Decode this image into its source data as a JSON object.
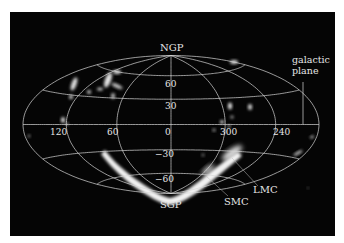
{
  "figure": {
    "background_color": "#050505",
    "grid_color": "#d8d8d8",
    "emission_color": "#ffffff",
    "projection": {
      "center_x": 171,
      "center_y": 124.5,
      "radius_x": 148,
      "radius_y": 69
    },
    "labels": {
      "north_pole": "NGP",
      "south_pole": "SGP",
      "galactic_plane": "galactic",
      "galactic_plane_2": "plane",
      "lmc": "LMC",
      "smc": "SMC"
    },
    "latitude_labels": [
      "60",
      "30",
      "0",
      "−30",
      "−60"
    ],
    "longitude_labels": [
      "120",
      "60",
      "0",
      "300",
      "240"
    ],
    "latitude_grid_deg": [
      60,
      30,
      0,
      -30,
      -60
    ],
    "longitude_grid_deg": [
      120,
      60,
      0,
      -60,
      -120
    ]
  }
}
